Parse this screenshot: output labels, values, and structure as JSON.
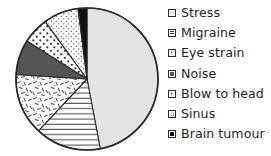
{
  "chart_data": {
    "type": "pie",
    "title": "",
    "subtitle": "",
    "xlabel": "",
    "ylabel": "",
    "grid": false,
    "legend_position": "right",
    "start_angle_deg": 0,
    "direction": "clockwise",
    "categories": [
      "Stress",
      "Migraine",
      "Eye strain",
      "Noise",
      "Blow to head",
      "Sinus",
      "Brain tumour"
    ],
    "values": [
      47,
      15,
      14,
      8,
      6,
      8,
      2
    ],
    "unit": "percent",
    "slices": [
      {
        "label": "Stress",
        "value": 47,
        "start_angle_deg": 0,
        "end_angle_deg": 169.2,
        "fill": "#e3e3e3",
        "pattern": "solid-light-gray",
        "stroke": "#2b2b2b"
      },
      {
        "label": "Migraine",
        "value": 15,
        "start_angle_deg": 169.2,
        "end_angle_deg": 223.2,
        "fill": "#ffffff",
        "pattern": "horizontal-lines",
        "stroke": "#2b2b2b"
      },
      {
        "label": "Eye strain",
        "value": 14,
        "start_angle_deg": 223.2,
        "end_angle_deg": 273.6,
        "fill": "#ffffff",
        "pattern": "scattered-dashes",
        "stroke": "#2b2b2b"
      },
      {
        "label": "Noise",
        "value": 8,
        "start_angle_deg": 273.6,
        "end_angle_deg": 302.4,
        "fill": "#555555",
        "pattern": "solid-dark-gray",
        "stroke": "#2b2b2b"
      },
      {
        "label": "Blow to head",
        "value": 6,
        "start_angle_deg": 302.4,
        "end_angle_deg": 324.0,
        "fill": "#ffffff",
        "pattern": "coarse-dots",
        "stroke": "#2b2b2b"
      },
      {
        "label": "Sinus",
        "value": 8,
        "start_angle_deg": 324.0,
        "end_angle_deg": 352.8,
        "fill": "#ffffff",
        "pattern": "fine-dots",
        "stroke": "#2b2b2b"
      },
      {
        "label": "Brain tumour",
        "value": 2,
        "start_angle_deg": 352.8,
        "end_angle_deg": 360.0,
        "fill": "#111111",
        "pattern": "solid-black",
        "stroke": "#2b2b2b"
      }
    ],
    "geometry": {
      "center_x": 87,
      "center_y": 79,
      "radius": 71
    }
  },
  "legend": {
    "items": [
      {
        "label": "Stress",
        "swatch": "solid-light-gray-swatch"
      },
      {
        "label": "Migraine",
        "swatch": "horizontal-lines-swatch"
      },
      {
        "label": "Eye strain",
        "swatch": "scattered-dashes-swatch"
      },
      {
        "label": "Noise",
        "swatch": "solid-dark-gray-swatch"
      },
      {
        "label": "Blow to head",
        "swatch": "coarse-dots-swatch"
      },
      {
        "label": "Sinus",
        "swatch": "fine-dots-swatch"
      },
      {
        "label": "Brain tumour",
        "swatch": "solid-black-swatch"
      }
    ]
  },
  "colors": {
    "stress": "#e3e3e3",
    "noise": "#555555",
    "brain_tumour": "#111111",
    "outline": "#2b2b2b",
    "background": "#ffffff",
    "text": "#1f1f1f"
  }
}
